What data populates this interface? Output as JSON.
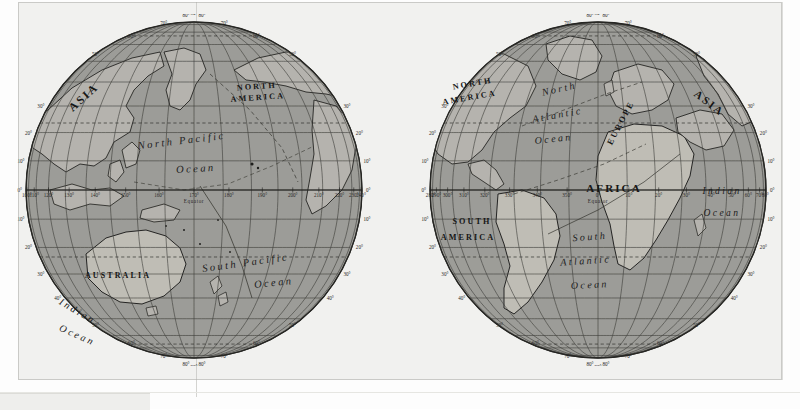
{
  "document": {
    "title": "World Map in Two Hemispheres",
    "paper_color": "#f1f1ef",
    "ocean_color": "#9d9d98",
    "land_color": "#b6b4ae",
    "graticule_color": "#3b3b38",
    "ink_color": "#161616",
    "degree_symbol": "°"
  },
  "hemispheres": [
    {
      "id": "western-pacific",
      "name": "Pacific Hemisphere",
      "center_longitude": 170,
      "continents": [
        {
          "label": "ASIA",
          "x": 72,
          "y": 86,
          "rotate": -42,
          "size": 11.5
        },
        {
          "label": "NORTH",
          "x": 243,
          "y": 75,
          "rotate": -4,
          "size": 8.2
        },
        {
          "label": "AMERICA",
          "x": 244,
          "y": 86,
          "rotate": -4,
          "size": 8.2
        },
        {
          "label": "AUSTRALIA",
          "x": 104,
          "y": 264,
          "rotate": 0,
          "size": 8.0
        }
      ],
      "oceans": [
        {
          "label": "North Pacific",
          "x": 168,
          "y": 130,
          "rotate": -7,
          "size": 10.5
        },
        {
          "label": "Ocean",
          "x": 182,
          "y": 158,
          "rotate": -3,
          "size": 10.5
        },
        {
          "label": "South Pacific",
          "x": 232,
          "y": 252,
          "rotate": -8,
          "size": 10.5
        },
        {
          "label": "Ocean",
          "x": 260,
          "y": 272,
          "rotate": -6,
          "size": 10.5
        },
        {
          "label": "Indian",
          "x": 62,
          "y": 300,
          "rotate": 30,
          "size": 10.0
        },
        {
          "label": "Ocean",
          "x": 62,
          "y": 324,
          "rotate": 24,
          "size": 10.0
        }
      ],
      "equator_ticks": [
        "100°",
        "110°",
        "120°",
        "130°",
        "140°",
        "150°",
        "160°",
        "170°",
        "180°",
        "190°",
        "200°",
        "210°",
        "220°",
        "230°",
        "240°"
      ],
      "equator_label": "Equator",
      "latitude_ticks_left": [
        "30°",
        "20°",
        "10°",
        "0°",
        "10°",
        "20°",
        "30°",
        "40°"
      ],
      "latitude_ticks_right": [
        "30°",
        "20°",
        "10°",
        "0°",
        "10°",
        "20°",
        "30°",
        "40°"
      ],
      "polar_ticks_top": [
        "50°",
        "60°",
        "70°",
        "80°",
        "90°",
        "80°",
        "70°",
        "60°",
        "50°"
      ],
      "polar_ticks_bottom": [
        "50°",
        "60°",
        "70°",
        "80°",
        "90°",
        "80°",
        "70°",
        "60°",
        "50°"
      ]
    },
    {
      "id": "eastern-atlantic",
      "name": "Atlantic Hemisphere",
      "center_longitude": 0,
      "continents": [
        {
          "label": "NORTH",
          "x": 55,
          "y": 72,
          "rotate": -10,
          "size": 8.2
        },
        {
          "label": "AMERICA",
          "x": 52,
          "y": 86,
          "rotate": -10,
          "size": 8.2
        },
        {
          "label": "SOUTH",
          "x": 54,
          "y": 210,
          "rotate": 0,
          "size": 8.2
        },
        {
          "label": "AMERICA",
          "x": 50,
          "y": 226,
          "rotate": 0,
          "size": 8.2
        },
        {
          "label": "EUROPE",
          "x": 205,
          "y": 110,
          "rotate": -62,
          "size": 8.6
        },
        {
          "label": "AFRICA",
          "x": 196,
          "y": 178,
          "rotate": 0,
          "size": 11.0
        },
        {
          "label": "ASIA",
          "x": 289,
          "y": 92,
          "rotate": 38,
          "size": 11.0
        }
      ],
      "oceans": [
        {
          "label": "North",
          "x": 142,
          "y": 78,
          "rotate": -12,
          "size": 10.0
        },
        {
          "label": "Atlantic",
          "x": 140,
          "y": 104,
          "rotate": -10,
          "size": 10.0
        },
        {
          "label": "Ocean",
          "x": 136,
          "y": 128,
          "rotate": -6,
          "size": 10.0
        },
        {
          "label": "South",
          "x": 172,
          "y": 226,
          "rotate": -4,
          "size": 10.0
        },
        {
          "label": "Atlantic",
          "x": 168,
          "y": 250,
          "rotate": -4,
          "size": 10.0
        },
        {
          "label": "Ocean",
          "x": 172,
          "y": 274,
          "rotate": -3,
          "size": 10.0
        },
        {
          "label": "Indian",
          "x": 304,
          "y": 180,
          "rotate": 0,
          "size": 9.5
        },
        {
          "label": "Ocean",
          "x": 304,
          "y": 202,
          "rotate": 0,
          "size": 9.5
        }
      ],
      "equator_ticks": [
        "280°",
        "290°",
        "300°",
        "310°",
        "320°",
        "330°",
        "340°",
        "350°",
        "0°",
        "10°",
        "20°",
        "30°",
        "40°",
        "50°",
        "60°",
        "70°",
        "80°"
      ],
      "equator_label": "Equator",
      "latitude_ticks_left": [
        "30°",
        "20°",
        "10°",
        "0°",
        "10°",
        "20°",
        "30°",
        "40°"
      ],
      "latitude_ticks_right": [
        "30°",
        "20°",
        "10°",
        "0°",
        "10°",
        "20°",
        "30°",
        "40°"
      ],
      "polar_ticks_top": [
        "50°",
        "60°",
        "70°",
        "80°",
        "90°",
        "80°",
        "70°",
        "60°",
        "50°"
      ],
      "polar_ticks_bottom": [
        "50°",
        "60°",
        "70°",
        "80°",
        "90°",
        "80°",
        "70°",
        "60°",
        "50°"
      ]
    }
  ],
  "graticule": {
    "meridian_step_degrees": 10,
    "parallel_step_degrees": 10,
    "special_parallels": [
      "Tropic of Cancer",
      "Tropic of Capricorn",
      "Arctic Circle",
      "Antarctic Circle"
    ]
  }
}
